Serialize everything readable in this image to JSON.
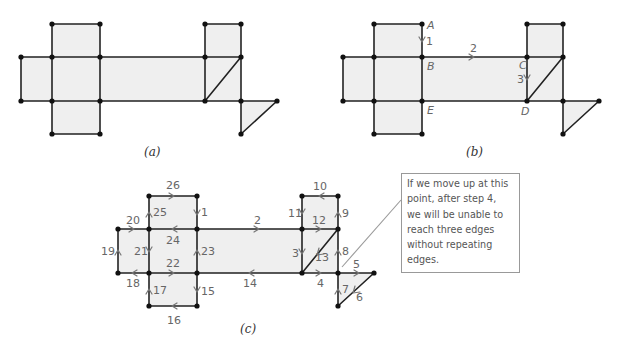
{
  "figure": {
    "panels": [
      {
        "id": "a",
        "caption": "(a)"
      },
      {
        "id": "b",
        "caption": "(b)"
      },
      {
        "id": "c",
        "caption": "(c)"
      }
    ],
    "panel_b_vertex_labels": [
      "A",
      "B",
      "C",
      "D",
      "E"
    ],
    "panel_b_edge_labels": [
      "1",
      "2",
      "3"
    ],
    "panel_c_edge_labels": [
      "1",
      "2",
      "3",
      "4",
      "5",
      "6",
      "7",
      "8",
      "9",
      "10",
      "11",
      "12",
      "13",
      "14",
      "15",
      "16",
      "17",
      "18",
      "19",
      "20",
      "21",
      "22",
      "23",
      "24",
      "25",
      "26"
    ],
    "callout": {
      "lines": [
        "If we move up at this",
        "point, after step 4,",
        "we will be unable to",
        "reach three edges",
        "without repeating",
        "edges."
      ]
    },
    "colors": {
      "face_fill": "#efefef",
      "edge": "#222222",
      "annotation": "#777777"
    }
  }
}
